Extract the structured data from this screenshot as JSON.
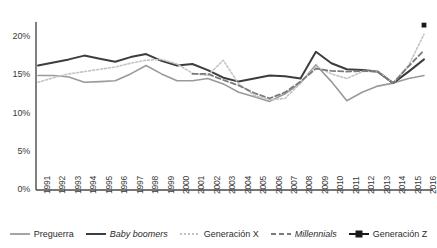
{
  "chart_data": {
    "type": "line",
    "title": "",
    "subtitle": "",
    "xlabel": "",
    "ylabel": "",
    "ylim": [
      0,
      22
    ],
    "yticks": [
      0,
      5,
      10,
      15,
      20
    ],
    "ytick_labels": [
      "0%",
      "5%",
      "10%",
      "15%",
      "20%"
    ],
    "grid": false,
    "legend_position": "bottom",
    "x": [
      1991,
      1992,
      1993,
      1994,
      1995,
      1996,
      1997,
      1998,
      1999,
      2000,
      2001,
      2002,
      2003,
      2004,
      2005,
      2006,
      2007,
      2008,
      2009,
      2010,
      2011,
      2012,
      2013,
      2014,
      2015,
      2016
    ],
    "xtick_labels": [
      "1991",
      "1992",
      "1993",
      "1994",
      "1995",
      "1996",
      "1997",
      "1998",
      "1999",
      "2000",
      "2001",
      "2002",
      "2003",
      "2004",
      "2005",
      "2006",
      "2007",
      "2008",
      "2009",
      "2010",
      "2011",
      "2012",
      "2013",
      "2014",
      "2015",
      "2016"
    ],
    "series": [
      {
        "name": "Preguerra",
        "style": "solid",
        "color": "#9a9a9a",
        "width": 1.6,
        "italic": false,
        "marker": "none",
        "values": [
          15.0,
          15.0,
          14.8,
          14.1,
          14.2,
          14.3,
          15.2,
          16.3,
          15.2,
          14.3,
          14.3,
          14.6,
          13.9,
          12.8,
          12.2,
          11.6,
          12.6,
          14.0,
          16.4,
          14.2,
          11.7,
          12.8,
          13.6,
          14.0,
          14.6,
          15.0
        ]
      },
      {
        "name": "Baby boomers",
        "style": "solid",
        "color": "#3d3d3d",
        "width": 2.0,
        "italic": true,
        "marker": "none",
        "values": [
          16.3,
          16.7,
          17.1,
          17.6,
          17.2,
          16.8,
          17.4,
          17.8,
          16.9,
          16.3,
          16.5,
          15.7,
          14.7,
          14.2,
          14.6,
          15.0,
          14.9,
          14.6,
          18.1,
          16.6,
          15.8,
          15.7,
          15.5,
          14.0,
          15.5,
          17.1
        ]
      },
      {
        "name": "Generación X",
        "style": "dotted",
        "color": "#c4c4c4",
        "width": 1.6,
        "italic": false,
        "marker": "none",
        "values": [
          14.1,
          14.7,
          15.2,
          15.5,
          15.8,
          16.1,
          16.6,
          17.0,
          17.1,
          16.5,
          15.3,
          15.0,
          17.0,
          13.9,
          12.4,
          11.8,
          12.0,
          14.0,
          16.2,
          15.2,
          14.6,
          15.5,
          15.6,
          14.0,
          16.3,
          20.4
        ]
      },
      {
        "name": "Millennials",
        "style": "dashed",
        "color": "#7a7a7a",
        "width": 1.8,
        "italic": true,
        "marker": "none",
        "values": [
          null,
          null,
          null,
          null,
          null,
          null,
          null,
          null,
          null,
          null,
          15.2,
          15.2,
          14.4,
          13.7,
          12.7,
          12.0,
          12.8,
          14.2,
          15.9,
          15.6,
          15.5,
          15.6,
          15.5,
          14.0,
          16.2,
          18.3
        ]
      },
      {
        "name": "Generación Z",
        "style": "solid",
        "color": "#1a1a1a",
        "width": 2.0,
        "italic": false,
        "marker": "square",
        "values": [
          null,
          null,
          null,
          null,
          null,
          null,
          null,
          null,
          null,
          null,
          null,
          null,
          null,
          null,
          null,
          null,
          null,
          null,
          null,
          null,
          null,
          null,
          null,
          null,
          null,
          21.6
        ]
      }
    ]
  },
  "legend": {
    "items": [
      {
        "label": "Preguerra",
        "key": "preguerra"
      },
      {
        "label": "Baby boomers",
        "key": "baby-boomers"
      },
      {
        "label": "Generación X",
        "key": "generacion-x"
      },
      {
        "label": "Millennials",
        "key": "millennials"
      },
      {
        "label": "Generación Z",
        "key": "generacion-z"
      }
    ]
  }
}
